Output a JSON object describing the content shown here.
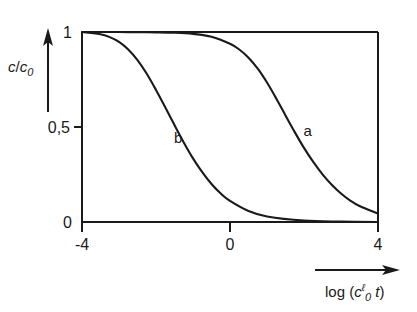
{
  "chart_data": {
    "type": "line",
    "title": "",
    "subtitle": "",
    "xlabel": "log (c₀ℓ t)",
    "xlabel_parts": {
      "prefix": "log (",
      "base": "c",
      "subscript": "0",
      "superscript": "ℓ",
      "variable": "t",
      "suffix": ")"
    },
    "ylabel": "c/c₀",
    "ylabel_parts": {
      "numerator": "c",
      "slash": "/",
      "denominator": "c",
      "denominator_subscript": "0"
    },
    "xlim": [
      -4,
      4
    ],
    "ylim": [
      0,
      1
    ],
    "x_ticks": [
      -4,
      0,
      4
    ],
    "x_tick_labels": [
      "-4",
      "0",
      "4"
    ],
    "y_ticks": [
      0,
      0.5,
      1
    ],
    "y_tick_labels": [
      "0",
      "0,5",
      "1"
    ],
    "grid": false,
    "legend_position": "inline-annotation",
    "axis_color": "#1a1a1a",
    "curve_color": "#1a1a1a",
    "background_color": "#ffffff",
    "annotations": [
      {
        "label": "b",
        "x": -1.4,
        "y": 0.44
      },
      {
        "label": "a",
        "x": 2.1,
        "y": 0.48
      }
    ],
    "series": [
      {
        "name": "a",
        "label": "a",
        "midpoint_x": 1.25,
        "slope_decades": 1.05,
        "x": [
          -4.0,
          -3.5,
          -3.0,
          -2.5,
          -2.0,
          -1.5,
          -1.0,
          -0.5,
          0.0,
          0.25,
          0.5,
          0.75,
          1.0,
          1.25,
          1.5,
          1.75,
          2.0,
          2.25,
          2.5,
          2.75,
          3.0,
          3.25,
          3.5,
          4.0
        ],
        "y": [
          1.0,
          1.0,
          1.0,
          0.999,
          0.998,
          0.996,
          0.99,
          0.975,
          0.938,
          0.908,
          0.865,
          0.807,
          0.734,
          0.65,
          0.561,
          0.473,
          0.39,
          0.316,
          0.251,
          0.196,
          0.15,
          0.113,
          0.084,
          0.044
        ]
      },
      {
        "name": "b",
        "label": "b",
        "midpoint_x": -2.0,
        "slope_decades": 1.05,
        "x": [
          -4.0,
          -3.75,
          -3.5,
          -3.25,
          -3.0,
          -2.75,
          -2.5,
          -2.25,
          -2.0,
          -1.75,
          -1.5,
          -1.25,
          -1.0,
          -0.75,
          -0.5,
          -0.25,
          0.0,
          0.5,
          1.0,
          2.0,
          3.0,
          4.0
        ],
        "y": [
          1.0,
          0.995,
          0.988,
          0.973,
          0.948,
          0.908,
          0.852,
          0.78,
          0.695,
          0.604,
          0.51,
          0.419,
          0.335,
          0.262,
          0.2,
          0.15,
          0.111,
          0.058,
          0.029,
          0.007,
          0.002,
          0.0
        ]
      }
    ]
  },
  "figure": {
    "name": "concentration-decay-plot",
    "x_axis_arrow": true,
    "y_axis_arrow": true
  }
}
